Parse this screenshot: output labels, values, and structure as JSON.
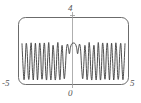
{
  "figure": {
    "name": "oscillatory-function-plot",
    "background_color": "#ffffff",
    "frame_color": "#5a5a5a",
    "curve_color": "#3b3b3b",
    "axis_color": "#9a9a9a",
    "label_color": "#555555"
  },
  "labels": {
    "x_min": "-5",
    "x_max": "5",
    "y_max": "4",
    "origin": "0"
  },
  "chart_data": {
    "type": "line",
    "title": "",
    "xlabel": "",
    "ylabel": "",
    "xlim": [
      -5,
      5
    ],
    "ylim": [
      0,
      4
    ],
    "xticks": [
      -5,
      0,
      5
    ],
    "xticklabels": [
      "-5",
      "0",
      "5"
    ],
    "yticks": [
      4
    ],
    "yticklabels": [
      "4"
    ],
    "grid": false,
    "legend": null,
    "frame": "rounded-rectangle",
    "series": [
      {
        "name": "chirp",
        "description": "Symmetric oscillation whose frequency increases with |x|; broad central hump near x=0 peaking just under 3, then progressively narrower peaks of equal height toward x=+/-5.",
        "x": [
          -5.0,
          -4.9,
          -4.8,
          -4.7,
          -4.6,
          -4.5,
          -4.4,
          -4.3,
          -4.2,
          -4.1,
          -4.0,
          -3.9,
          -3.8,
          -3.7,
          -3.6,
          -3.5,
          -3.4,
          -3.3,
          -3.2,
          -3.1,
          -3.0,
          -2.9,
          -2.8,
          -2.7,
          -2.6,
          -2.5,
          -2.4,
          -2.3,
          -2.2,
          -2.1,
          -2.0,
          -1.9,
          -1.8,
          -1.7,
          -1.6,
          -1.5,
          -1.4,
          -1.3,
          -1.2,
          -1.1,
          -1.0,
          -0.9,
          -0.8,
          -0.7,
          -0.6,
          -0.5,
          -0.4,
          -0.3,
          -0.2,
          -0.1,
          0.0,
          0.1,
          0.2,
          0.3,
          0.4,
          0.5,
          0.6,
          0.7,
          0.8,
          0.9,
          1.0,
          1.1,
          1.2,
          1.3,
          1.4,
          1.5,
          1.6,
          1.7,
          1.8,
          1.9,
          2.0,
          2.1,
          2.2,
          2.3,
          2.4,
          2.5,
          2.6,
          2.7,
          2.8,
          2.9,
          3.0,
          3.1,
          3.2,
          3.3,
          3.4,
          3.5,
          3.6,
          3.7,
          3.8,
          3.9,
          4.0,
          4.1,
          4.2,
          4.3,
          4.4,
          4.5,
          4.6,
          4.7,
          4.8,
          4.9,
          5.0
        ],
        "y": [
          2.9,
          1.11,
          0.02,
          1.23,
          2.89,
          2.31,
          0.37,
          0.22,
          2.18,
          2.93,
          1.0,
          0.01,
          1.52,
          2.95,
          1.63,
          0.01,
          1.17,
          2.9,
          2.37,
          0.26,
          0.4,
          2.51,
          2.82,
          0.66,
          0.05,
          1.81,
          2.99,
          1.11,
          0.0,
          1.05,
          2.74,
          2.08,
          0.12,
          0.43,
          2.32,
          2.92,
          0.64,
          0.09,
          1.9,
          2.76,
          1.27,
          0.11,
          0.84,
          2.31,
          2.86,
          2.6,
          2.1,
          2.59,
          2.85,
          2.94,
          2.96,
          2.94,
          2.85,
          2.59,
          2.1,
          2.6,
          2.86,
          2.31,
          0.84,
          0.11,
          1.27,
          2.76,
          1.9,
          0.09,
          0.64,
          2.92,
          2.32,
          0.43,
          0.12,
          2.08,
          2.74,
          1.05,
          0.0,
          1.11,
          2.99,
          1.81,
          0.05,
          0.66,
          2.82,
          2.51,
          0.4,
          0.26,
          2.37,
          2.9,
          1.17,
          0.01,
          1.63,
          2.95,
          1.52,
          0.01,
          1.0,
          2.93,
          2.18,
          0.22,
          0.37,
          2.31,
          2.89,
          1.23,
          0.02,
          1.11,
          2.9
        ]
      }
    ]
  }
}
